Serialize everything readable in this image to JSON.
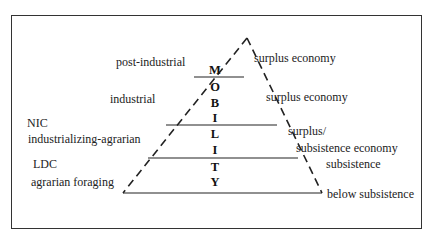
{
  "diagram": {
    "type": "pyramid",
    "axis_label_letters": [
      "M",
      "O",
      "B",
      "I",
      "L",
      "I",
      "T",
      "Y"
    ],
    "axis_label_word": "MOBILITY",
    "left_labels": [
      {
        "lines": [
          "post-industrial"
        ]
      },
      {
        "lines": [
          "industrial"
        ]
      },
      {
        "lines": [
          "NIC",
          "industrializing-agrarian"
        ]
      },
      {
        "lines": [
          "LDC",
          "agrarian foraging"
        ]
      }
    ],
    "right_labels": [
      {
        "lines": [
          "surplus economy"
        ]
      },
      {
        "lines": [
          "surplus economy"
        ]
      },
      {
        "lines": [
          "surplus/",
          "subsistence economy"
        ]
      },
      {
        "lines": [
          "subsistence"
        ]
      },
      {
        "lines": [
          "below subsistence"
        ]
      }
    ],
    "colors": {
      "line": "#222222",
      "frame": "#333333",
      "background": "#ffffff"
    }
  }
}
